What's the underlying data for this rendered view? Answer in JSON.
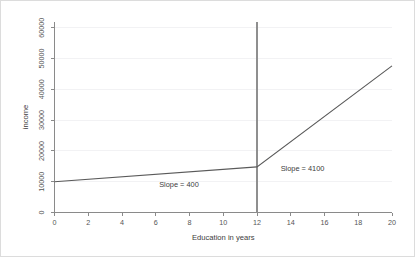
{
  "chart_data": {
    "type": "line",
    "title": "",
    "xlabel": "Education in years",
    "ylabel": "income",
    "xlim": [
      0,
      20
    ],
    "ylim": [
      0,
      62000
    ],
    "grid": true,
    "legend": "none",
    "x_ticks": [
      0,
      2,
      4,
      6,
      8,
      10,
      12,
      14,
      16,
      18,
      20
    ],
    "x_tick_labels": [
      "0",
      "2",
      "4",
      "6",
      "8",
      "10",
      "12",
      "14",
      "16",
      "18",
      "20"
    ],
    "y_ticks": [
      0,
      10000,
      20000,
      30000,
      40000,
      50000,
      60000
    ],
    "y_tick_labels": [
      "0",
      "10000",
      "20000",
      "30000",
      "40000",
      "50000",
      "60000"
    ],
    "series": [
      {
        "name": "income-piecewise",
        "x": [
          0,
          12,
          20
        ],
        "values": [
          10000,
          14800,
          47600
        ],
        "segments": [
          {
            "name": "pre-threshold",
            "x_start": 0,
            "x_end": 12,
            "y_start": 10000,
            "y_end": 14800,
            "slope": 400
          },
          {
            "name": "post-threshold",
            "x_start": 12,
            "x_end": 20,
            "y_start": 14800,
            "y_end": 47600,
            "slope": 4100
          }
        ]
      }
    ],
    "reference_lines": [
      {
        "name": "threshold",
        "orientation": "vertical",
        "x": 12,
        "y_start": 0,
        "y_end": 62000
      }
    ],
    "annotations": [
      {
        "name": "slope-pre-label",
        "text": "Slope = 400",
        "x": 6.2,
        "y": 8200
      },
      {
        "name": "slope-post-label",
        "text": "Slope = 4100",
        "x": 13.4,
        "y": 13400
      }
    ]
  },
  "axes": {
    "x_title": "Education in years",
    "y_title": "income"
  },
  "annotations": {
    "slope_pre": "Slope = 400",
    "slope_post": "Slope = 4100"
  },
  "colors": {
    "data_line": "#5a5a5a",
    "axis": "#8a8a8a",
    "reference_line": "#8f8f8f",
    "gridline": "#f2f2f4",
    "background": "#ffffff",
    "border": "#dcdcdc"
  }
}
